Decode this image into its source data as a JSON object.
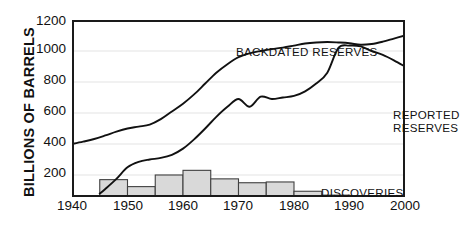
{
  "chart_data": {
    "type": "line",
    "title": "",
    "xlabel": "",
    "ylabel": "BILLIONS OF BARRELS",
    "xlim": [
      1940,
      2000
    ],
    "ylim": [
      58,
      1200
    ],
    "grid": true,
    "grid_axis": "y",
    "legend": "inline-annotations",
    "xticks": [
      1940,
      1950,
      1960,
      1970,
      1980,
      1990,
      2000
    ],
    "yticks": [
      200,
      400,
      600,
      800,
      1000,
      1200
    ],
    "annotations": [
      {
        "text": "BACKDATED RESERVES",
        "series": "backdated_reserves"
      },
      {
        "text": "REPORTED\nRESERVES",
        "series": "reported_reserves"
      },
      {
        "text": "DISCOVERIES",
        "series": "discoveries"
      }
    ],
    "series": [
      {
        "name": "BACKDATED RESERVES",
        "type": "line",
        "x": [
          1940,
          1942,
          1944,
          1946,
          1948,
          1950,
          1952,
          1954,
          1956,
          1958,
          1960,
          1962,
          1964,
          1966,
          1968,
          1970,
          1972,
          1974,
          1976,
          1978,
          1980,
          1982,
          1984,
          1986,
          1988,
          1990,
          1992,
          1994,
          1996,
          1998,
          2000
        ],
        "values": [
          400,
          415,
          432,
          455,
          480,
          500,
          512,
          525,
          560,
          610,
          660,
          720,
          790,
          860,
          915,
          960,
          985,
          1000,
          1012,
          1022,
          1035,
          1048,
          1055,
          1058,
          1055,
          1050,
          1040,
          1045,
          1060,
          1080,
          1100
        ]
      },
      {
        "name": "REPORTED RESERVES",
        "type": "line",
        "x": [
          1945,
          1946,
          1948,
          1950,
          1952,
          1954,
          1956,
          1958,
          1960,
          1962,
          1964,
          1966,
          1968,
          1970,
          1972,
          1974,
          1976,
          1978,
          1980,
          1982,
          1984,
          1986,
          1988,
          1990,
          1992,
          1994,
          1996,
          1998,
          2000
        ],
        "values": [
          80,
          110,
          175,
          250,
          285,
          300,
          310,
          330,
          370,
          430,
          500,
          575,
          640,
          690,
          640,
          705,
          690,
          700,
          710,
          740,
          790,
          860,
          1020,
          1035,
          1030,
          1000,
          975,
          940,
          900
        ]
      },
      {
        "name": "DISCOVERIES",
        "type": "bar",
        "bin_width": 5,
        "bins": [
          "1940-1945",
          "1945-1950",
          "1950-1955",
          "1955-1960",
          "1960-1965",
          "1965-1970",
          "1970-1975",
          "1975-1980",
          "1980-1985",
          "1985-1990",
          "1990-1995",
          "1995-2000"
        ],
        "x": [
          1940,
          1945,
          1950,
          1955,
          1960,
          1965,
          1970,
          1975,
          1980,
          1985,
          1990,
          1995
        ],
        "values": [
          60,
          170,
          125,
          200,
          230,
          175,
          150,
          155,
          95,
          70,
          40,
          20
        ]
      }
    ]
  },
  "axis": {
    "y_title": "BILLIONS OF BARRELS",
    "y_tick_labels": [
      "1200",
      "1000",
      "800",
      "600",
      "400",
      "200"
    ],
    "x_tick_labels": [
      "1940",
      "1950",
      "1960",
      "1970",
      "1980",
      "1990",
      "2000"
    ]
  },
  "labels": {
    "backdated": "BACKDATED RESERVES",
    "reported_line1": "REPORTED",
    "reported_line2": "RESERVES",
    "discoveries": "DISCOVERIES"
  },
  "style": {
    "line_color": "#111111",
    "bar_fill": "#d9d9d9",
    "bar_stroke": "#404040",
    "grid_color": "#ececec",
    "frame_color": "#1a1a1a",
    "background": "#ffffff"
  }
}
